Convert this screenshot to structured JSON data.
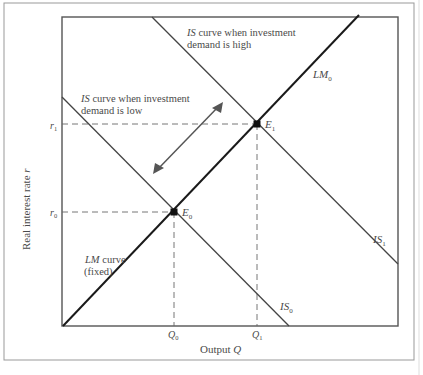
{
  "figure": {
    "y_axis_label_prefix": "Real interest rate ",
    "y_axis_label_var": "r",
    "x_axis_label_prefix": "Output ",
    "x_axis_label_var": "Q",
    "r1_label": "r",
    "r1_sub": "1",
    "r0_label": "r",
    "r0_sub": "0",
    "q0_label": "Q",
    "q0_sub": "0",
    "q1_label": "Q",
    "q1_sub": "1",
    "e1_label": "E",
    "e1_sub": "1",
    "e0_label": "E",
    "e0_sub": "0",
    "lm0_label": "LM",
    "lm0_sub": "0",
    "is1_label": "IS",
    "is1_sub": "1",
    "is0_label": "IS",
    "is0_sub": "0",
    "is_high_line1_it": "IS",
    "is_high_line1_rest": " curve when investment",
    "is_high_line2": "demand is high",
    "is_low_line1_it": "IS",
    "is_low_line1_rest": " curve when investment",
    "is_low_line2": "demand is low",
    "lm_fixed_line1_it": "LM",
    "lm_fixed_line1_rest": " curve",
    "lm_fixed_line2": "(fixed)"
  },
  "colors": {
    "axis": "#555555",
    "lm": "#1a1a1a",
    "is": "#444444",
    "dashed": "#666666",
    "text": "#4a4a4a"
  }
}
